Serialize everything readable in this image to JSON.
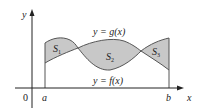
{
  "figure": {
    "axis_labels": {
      "x": "x",
      "y": "y",
      "origin": "0"
    },
    "tick_labels": {
      "a": "a",
      "b": "b"
    },
    "curve_labels": {
      "g": "y = g(x)",
      "f": "y = f(x)"
    },
    "region_labels": {
      "s1": "S",
      "s1_sub": "1",
      "s2": "S",
      "s2_sub": "2",
      "s3": "S",
      "s3_sub": "3"
    },
    "colors": {
      "fill": "#c8c8c8",
      "stroke": "#555555",
      "axis": "#222222"
    }
  }
}
